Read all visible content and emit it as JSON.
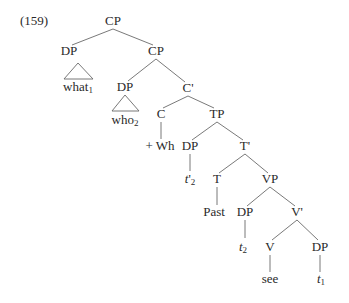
{
  "example_number": "(159)",
  "tree": {
    "root": "CP",
    "nodes": {
      "cp_root": "CP",
      "dp_what": "DP",
      "what": "what",
      "what_index": "1",
      "cp_inner": "CP",
      "dp_who": "DP",
      "who": "who",
      "who_index": "2",
      "c_bar": "C'",
      "c": "C",
      "plus_wh": "+ Wh",
      "tp": "TP",
      "dp_spec_tp": "DP",
      "trace_t_prime": "t",
      "trace_t_prime_mark": "'",
      "trace_t_prime_index": "2",
      "t_bar": "T'",
      "t": "T",
      "past": "Past",
      "vp": "VP",
      "dp_spec_vp": "DP",
      "trace_t2": "t",
      "trace_t2_index": "2",
      "v_bar": "V'",
      "v": "V",
      "see": "see",
      "dp_obj": "DP",
      "trace_t1": "t",
      "trace_t1_index": "1"
    },
    "structure": "[CP [DP what1] [CP [DP who2] [C' [C +Wh] [TP [DP t'2] [T' [T Past] [VP [DP t2] [V' [V see] [DP t1]]]]]]]]"
  }
}
